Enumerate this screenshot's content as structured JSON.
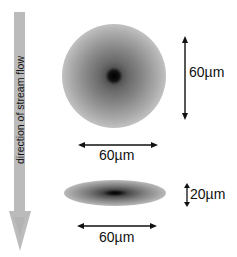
{
  "flow_arrow": {
    "label": "direction of stream flow",
    "color": "#b8b8b8",
    "direction": "down"
  },
  "round_spot": {
    "width_label": "60µm",
    "height_label": "60µm"
  },
  "flat_spot": {
    "width_label": "60µm",
    "height_label": "20µm"
  }
}
